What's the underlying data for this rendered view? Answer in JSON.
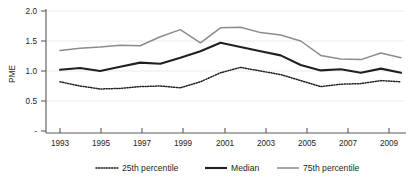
{
  "chart_data": {
    "type": "line",
    "title": "",
    "subtitle": "",
    "xlabel": "",
    "ylabel": "PME",
    "xlim": [
      1993,
      2010
    ],
    "ylim": [
      0,
      2.0
    ],
    "grid": true,
    "legend_position": "bottom",
    "x": [
      1993,
      1994,
      1995,
      1996,
      1997,
      1998,
      1999,
      2000,
      2001,
      2002,
      2003,
      2004,
      2005,
      2006,
      2007,
      2008,
      2009,
      2010
    ],
    "xtick_labels": [
      "1993",
      "1995",
      "1997",
      "1999",
      "2001",
      "2003",
      "2005",
      "2007",
      "2009"
    ],
    "xtick_values": [
      1993,
      1995,
      1997,
      1999,
      2001,
      2003,
      2005,
      2007,
      2009
    ],
    "ytick_labels": [
      "-",
      "0.5",
      "1.0",
      "1.5",
      "2.0"
    ],
    "ytick_values": [
      0,
      0.5,
      1.0,
      1.5,
      2.0
    ],
    "series": [
      {
        "name": "25th percentile",
        "style": "dotted",
        "color": "#231f20",
        "values": [
          0.82,
          0.75,
          0.7,
          0.71,
          0.74,
          0.75,
          0.72,
          0.82,
          0.97,
          1.06,
          1.0,
          0.94,
          0.84,
          0.74,
          0.78,
          0.79,
          0.84,
          0.82
        ]
      },
      {
        "name": "Median",
        "style": "solid-thick",
        "color": "#231f20",
        "values": [
          1.02,
          1.05,
          1.0,
          1.07,
          1.14,
          1.12,
          1.22,
          1.33,
          1.47,
          1.4,
          1.33,
          1.26,
          1.1,
          1.01,
          1.03,
          0.97,
          1.04,
          0.97
        ]
      },
      {
        "name": "75th percentile",
        "style": "solid-gray",
        "color": "#8c8c8c",
        "values": [
          1.34,
          1.38,
          1.4,
          1.43,
          1.42,
          1.57,
          1.69,
          1.47,
          1.72,
          1.73,
          1.64,
          1.6,
          1.5,
          1.26,
          1.2,
          1.19,
          1.3,
          1.22
        ]
      }
    ],
    "caption": ""
  },
  "legend": {
    "items": [
      {
        "label": "25th percentile"
      },
      {
        "label": "Median"
      },
      {
        "label": "75th percentile"
      }
    ]
  },
  "axis": {
    "y_title": "PME"
  }
}
